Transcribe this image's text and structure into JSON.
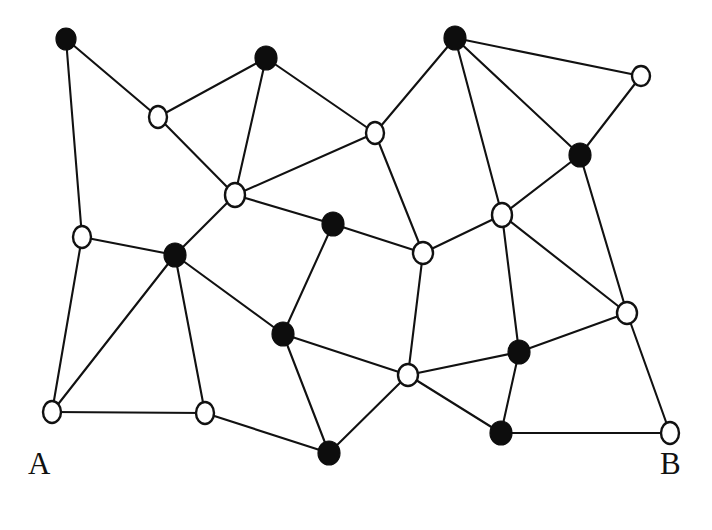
{
  "figure": {
    "kind": "undirected-graph-drawing",
    "background_color": "#ffffff",
    "edge_color": "#111111",
    "filled_node_color": "#0d0d0d",
    "open_node_fill": "#ffffff",
    "open_node_stroke": "#111111",
    "width": 712,
    "height": 530
  },
  "labels": {
    "bottom_left": "A",
    "bottom_right": "B"
  },
  "chart_data": {
    "type": "scatter",
    "title": "",
    "xlabel": "",
    "ylabel": "",
    "grid": false,
    "legend": "none",
    "node_count": 17,
    "filled_node_count": 8,
    "open_node_count": 9,
    "edge_count": 35,
    "nodes": [
      {
        "id": "n1",
        "x": 66,
        "y": 39,
        "fill": "filled",
        "rx": 10,
        "ry": 11
      },
      {
        "id": "n2",
        "x": 266,
        "y": 58,
        "fill": "filled",
        "rx": 11,
        "ry": 12
      },
      {
        "id": "n3",
        "x": 455,
        "y": 38,
        "fill": "filled",
        "rx": 11,
        "ry": 12
      },
      {
        "id": "n4",
        "x": 641,
        "y": 76,
        "fill": "open",
        "rx": 9,
        "ry": 10
      },
      {
        "id": "n5",
        "x": 158,
        "y": 117,
        "fill": "open",
        "rx": 9,
        "ry": 11
      },
      {
        "id": "n6",
        "x": 375,
        "y": 133,
        "fill": "open",
        "rx": 9,
        "ry": 11
      },
      {
        "id": "n7",
        "x": 580,
        "y": 155,
        "fill": "filled",
        "rx": 11,
        "ry": 12
      },
      {
        "id": "n8",
        "x": 235,
        "y": 195,
        "fill": "open",
        "rx": 10,
        "ry": 12
      },
      {
        "id": "n9",
        "x": 502,
        "y": 215,
        "fill": "open",
        "rx": 10,
        "ry": 12
      },
      {
        "id": "n10",
        "x": 333,
        "y": 224,
        "fill": "filled",
        "rx": 11,
        "ry": 12
      },
      {
        "id": "n11",
        "x": 82,
        "y": 237,
        "fill": "open",
        "rx": 9,
        "ry": 11
      },
      {
        "id": "n12",
        "x": 423,
        "y": 253,
        "fill": "open",
        "rx": 10,
        "ry": 11
      },
      {
        "id": "n13",
        "x": 175,
        "y": 255,
        "fill": "filled",
        "rx": 11,
        "ry": 12
      },
      {
        "id": "n14",
        "x": 627,
        "y": 313,
        "fill": "open",
        "rx": 10,
        "ry": 11
      },
      {
        "id": "n15",
        "x": 283,
        "y": 334,
        "fill": "filled",
        "rx": 11,
        "ry": 12
      },
      {
        "id": "n16",
        "x": 519,
        "y": 352,
        "fill": "filled",
        "rx": 11,
        "ry": 12
      },
      {
        "id": "n17",
        "x": 408,
        "y": 375,
        "fill": "open",
        "rx": 10,
        "ry": 11
      },
      {
        "id": "n18",
        "x": 52,
        "y": 412,
        "fill": "open",
        "rx": 9,
        "ry": 11
      },
      {
        "id": "n19",
        "x": 205,
        "y": 413,
        "fill": "open",
        "rx": 9,
        "ry": 11
      },
      {
        "id": "n20",
        "x": 501,
        "y": 433,
        "fill": "filled",
        "rx": 11,
        "ry": 12
      },
      {
        "id": "n21",
        "x": 670,
        "y": 433,
        "fill": "open",
        "rx": 9,
        "ry": 11
      },
      {
        "id": "n22",
        "x": 329,
        "y": 453,
        "fill": "filled",
        "rx": 11,
        "ry": 12
      }
    ],
    "edges": [
      [
        "n1",
        "n5"
      ],
      [
        "n1",
        "n11"
      ],
      [
        "n5",
        "n2"
      ],
      [
        "n5",
        "n8"
      ],
      [
        "n2",
        "n8"
      ],
      [
        "n2",
        "n6"
      ],
      [
        "n6",
        "n8"
      ],
      [
        "n6",
        "n3"
      ],
      [
        "n6",
        "n12"
      ],
      [
        "n3",
        "n9"
      ],
      [
        "n3",
        "n4"
      ],
      [
        "n3",
        "n7"
      ],
      [
        "n4",
        "n7"
      ],
      [
        "n7",
        "n9"
      ],
      [
        "n7",
        "n14"
      ],
      [
        "n8",
        "n10"
      ],
      [
        "n8",
        "n13"
      ],
      [
        "n10",
        "n12"
      ],
      [
        "n10",
        "n15"
      ],
      [
        "n9",
        "n12"
      ],
      [
        "n9",
        "n14"
      ],
      [
        "n9",
        "n16"
      ],
      [
        "n11",
        "n13"
      ],
      [
        "n11",
        "n18"
      ],
      [
        "n12",
        "n17"
      ],
      [
        "n13",
        "n15"
      ],
      [
        "n13",
        "n18"
      ],
      [
        "n13",
        "n19"
      ],
      [
        "n14",
        "n16"
      ],
      [
        "n14",
        "n21"
      ],
      [
        "n15",
        "n17"
      ],
      [
        "n15",
        "n22"
      ],
      [
        "n16",
        "n17"
      ],
      [
        "n16",
        "n20"
      ],
      [
        "n17",
        "n20"
      ],
      [
        "n17",
        "n22"
      ],
      [
        "n18",
        "n19"
      ],
      [
        "n19",
        "n22"
      ],
      [
        "n20",
        "n21"
      ]
    ]
  }
}
